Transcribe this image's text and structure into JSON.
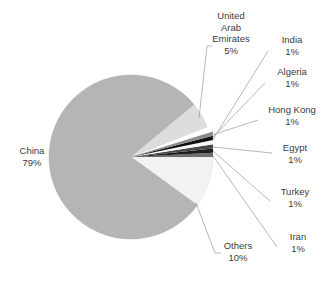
{
  "chart_data": {
    "type": "pie",
    "title": "",
    "categories": [
      "China",
      "Others",
      "United Arab Emirates",
      "India",
      "Algeria",
      "Hong Kong",
      "Egypt",
      "Turkey",
      "Iran"
    ],
    "values": [
      79,
      10,
      5,
      1,
      1,
      1,
      1,
      1,
      1
    ],
    "unit": "%",
    "legend": "none",
    "labels_position": "outside-with-leader-lines",
    "slices": [
      {
        "name": "China",
        "value": 79,
        "pct_text": "79%",
        "color": "#b5b5b5"
      },
      {
        "name": "Others",
        "value": 10,
        "pct_text": "10%",
        "color": "#f2f2f2"
      },
      {
        "name": "United Arab Emirates",
        "value": 5,
        "pct_text": "5%",
        "color": "#dddddd"
      },
      {
        "name": "India",
        "value": 1,
        "pct_text": "1%",
        "color": "#6f6f6f"
      },
      {
        "name": "Algeria",
        "value": 1,
        "pct_text": "1%",
        "color": "#1d1d1d"
      },
      {
        "name": "Hong Kong",
        "value": 1,
        "pct_text": "1%",
        "color": "#4a4a4a"
      },
      {
        "name": "Egypt",
        "value": 1,
        "pct_text": "1%",
        "color": "#f7f7f7"
      },
      {
        "name": "Turkey",
        "value": 1,
        "pct_text": "1%",
        "color": "#111111"
      },
      {
        "name": "Iran",
        "value": 1,
        "pct_text": "1%",
        "color": "#8a8a8a"
      }
    ]
  },
  "labels": {
    "china": {
      "name": "China",
      "pct": "79%"
    },
    "uae": {
      "name_line1": "United",
      "name_line2": "Arab",
      "name_line3": "Emirates",
      "pct": "5%"
    },
    "india": {
      "name": "India",
      "pct": "1%"
    },
    "algeria": {
      "name": "Algeria",
      "pct": "1%"
    },
    "hongkong": {
      "name": "Hong Kong",
      "pct": "1%"
    },
    "egypt": {
      "name": "Egypt",
      "pct": "1%"
    },
    "turkey": {
      "name": "Turkey",
      "pct": "1%"
    },
    "iran": {
      "name": "Iran",
      "pct": "1%"
    },
    "others": {
      "name": "Others",
      "pct": "10%"
    }
  },
  "style": {
    "background": "#ffffff",
    "text_color": "#3b3b3b",
    "leader_line_color": "#999999"
  }
}
